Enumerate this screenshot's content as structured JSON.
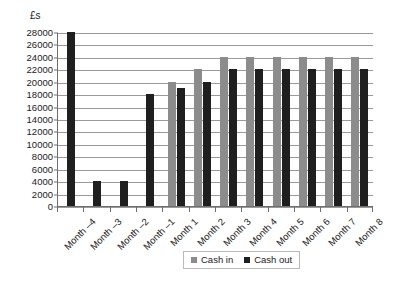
{
  "chart_data": {
    "type": "bar",
    "title": "",
    "subtitle": "",
    "xlabel": "",
    "ylabel": "£s",
    "ylim": [
      0,
      28000
    ],
    "ytick_step": 2000,
    "yticks": [
      28000,
      26000,
      24000,
      22000,
      20000,
      18000,
      16000,
      14000,
      12000,
      10000,
      8000,
      6000,
      4000,
      2000,
      0
    ],
    "ytick_labels": [
      "28000",
      "26000",
      "24000",
      "22000",
      "20000",
      "18000",
      "16000",
      "14000",
      "12000",
      "10000",
      "8000",
      "6000",
      "4000",
      "2000",
      "0"
    ],
    "grid": true,
    "grid_axis": "y",
    "legend_position": "bottom-right",
    "categories": [
      "Month –4",
      "Month –3",
      "Month –2",
      "Month –1",
      "Month 1",
      "Month 2",
      "Month 3",
      "Month 4",
      "Month 5",
      "Month 6",
      "Month 7",
      "Month 8"
    ],
    "series": [
      {
        "name": "Cash in",
        "color": "#8c8c8c",
        "values": [
          null,
          null,
          null,
          null,
          20000,
          22000,
          24000,
          24000,
          24000,
          24000,
          24000,
          24000
        ]
      },
      {
        "name": "Cash out",
        "color": "#1f1f1f",
        "values": [
          28000,
          4000,
          4000,
          18000,
          19000,
          20000,
          22000,
          22000,
          22000,
          22000,
          22000,
          22000
        ]
      }
    ]
  },
  "legend": {
    "items": [
      {
        "label": "Cash in",
        "color": "#8c8c8c"
      },
      {
        "label": "Cash out",
        "color": "#1f1f1f"
      }
    ]
  }
}
